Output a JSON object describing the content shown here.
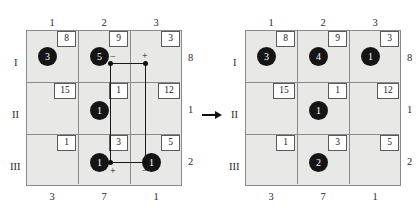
{
  "figure": {
    "type": "transportation-tableau-pivot",
    "caption": ""
  },
  "transition": {
    "arrow_icon": "right-arrow-icon"
  },
  "left_tableau": {
    "name": "before-pivot",
    "column_headers": [
      "1",
      "2",
      "3"
    ],
    "row_headers": [
      "I",
      "II",
      "III"
    ],
    "supply": [
      "8",
      "1",
      "2"
    ],
    "demand": [
      "3",
      "7",
      "1"
    ],
    "costs": [
      [
        "8",
        "9",
        "3"
      ],
      [
        "15",
        "1",
        "12"
      ],
      [
        "1",
        "3",
        "5"
      ]
    ],
    "allocations": [
      [
        "3",
        "5",
        ""
      ],
      [
        "",
        "1",
        ""
      ],
      [
        "",
        "1",
        "1"
      ]
    ],
    "loop": {
      "signs": [
        {
          "cell": "r1c2",
          "sign": "−"
        },
        {
          "cell": "r1c3",
          "sign": "+"
        },
        {
          "cell": "r3c2",
          "sign": "+"
        },
        {
          "cell": "r3c3",
          "sign": "−"
        }
      ]
    }
  },
  "right_tableau": {
    "name": "after-pivot",
    "column_headers": [
      "1",
      "2",
      "3"
    ],
    "row_headers": [
      "I",
      "II",
      "III"
    ],
    "supply": [
      "8",
      "1",
      "2"
    ],
    "demand": [
      "3",
      "7",
      "1"
    ],
    "costs": [
      [
        "8",
        "9",
        "3"
      ],
      [
        "15",
        "1",
        "12"
      ],
      [
        "1",
        "3",
        "5"
      ]
    ],
    "allocations": [
      [
        "3",
        "4",
        "1"
      ],
      [
        "",
        "1",
        ""
      ],
      [
        "",
        "2",
        ""
      ]
    ]
  }
}
